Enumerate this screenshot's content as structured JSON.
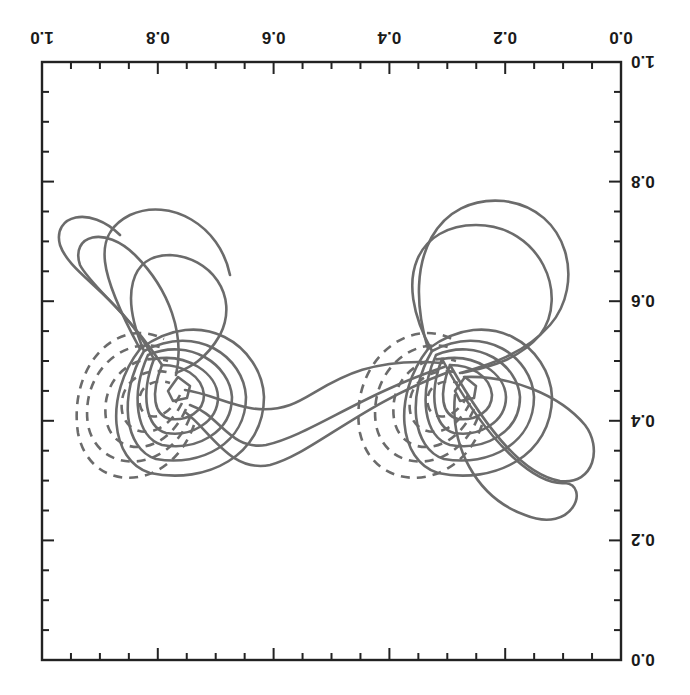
{
  "chart_data": {
    "type": "contour",
    "orientation": "rotated 180 degrees (upside down)",
    "title": "",
    "xlabel": "",
    "ylabel": "",
    "xlim": [
      0.0,
      1.0
    ],
    "ylim": [
      0.0,
      1.0
    ],
    "x_tick_labels": [
      "0.0",
      "0.2",
      "0.4",
      "0.6",
      "0.8",
      "1.0"
    ],
    "y_tick_labels": [
      "0.0",
      "0.2",
      "0.4",
      "0.6",
      "0.8",
      "1.0"
    ],
    "x_minor_ticks_per_major": 4,
    "y_minor_ticks_per_major": 4,
    "grid": false,
    "legend": null,
    "line_styles": {
      "positive_levels": "solid",
      "negative_levels": "dashed"
    },
    "line_color": "#6b6b6b",
    "features": [
      {
        "name": "dipole-right",
        "center_approx": {
          "x": 0.27,
          "y": 0.47
        },
        "description": "Dipole pair: solid closed contours (positive) on upper-left side, dashed (negative) on lower-right side, with a steep gradient line between them"
      },
      {
        "name": "dipole-left",
        "center_approx": {
          "x": 0.78,
          "y": 0.47
        },
        "description": "Dipole pair: solid closed contours (positive) and dashed (negative) contours, similar structure to right dipole"
      },
      {
        "name": "connecting-field-lines",
        "description": "Several solid S-shaped contour lines connecting the two dipoles across x = 0.35 to 0.7"
      }
    ],
    "approx_contour_levels_per_lobe": {
      "solid": 7,
      "dashed": 6
    }
  }
}
